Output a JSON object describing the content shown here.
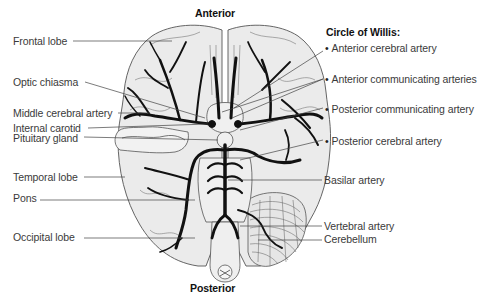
{
  "figure": {
    "title_top": "Anterior",
    "title_bottom": "Posterior",
    "colors": {
      "brain_fill": "#ebebeb",
      "outline": "#555555",
      "artery": "#111111",
      "leader": "#444444",
      "text": "#3a3a3a"
    }
  },
  "left_labels": [
    {
      "text": "Frontal lobe"
    },
    {
      "text": "Optic chiasma"
    },
    {
      "text": "Middle cerebral artery"
    },
    {
      "text": "Internal carotid"
    },
    {
      "text": "Pituitary gland"
    },
    {
      "text": "Temporal lobe"
    },
    {
      "text": "Pons"
    },
    {
      "text": "Occipital lobe"
    }
  ],
  "circle_of_willis": {
    "heading": "Circle of Willis:",
    "items": [
      {
        "text": "Anterior cerebral artery"
      },
      {
        "text": "Anterior communicating arteries"
      },
      {
        "text": "Posterior communicating artery"
      },
      {
        "text": "Posterior cerebral artery"
      }
    ]
  },
  "right_labels": [
    {
      "text": "Basilar artery"
    },
    {
      "text": "Vertebral artery"
    },
    {
      "text": "Cerebellum"
    }
  ]
}
